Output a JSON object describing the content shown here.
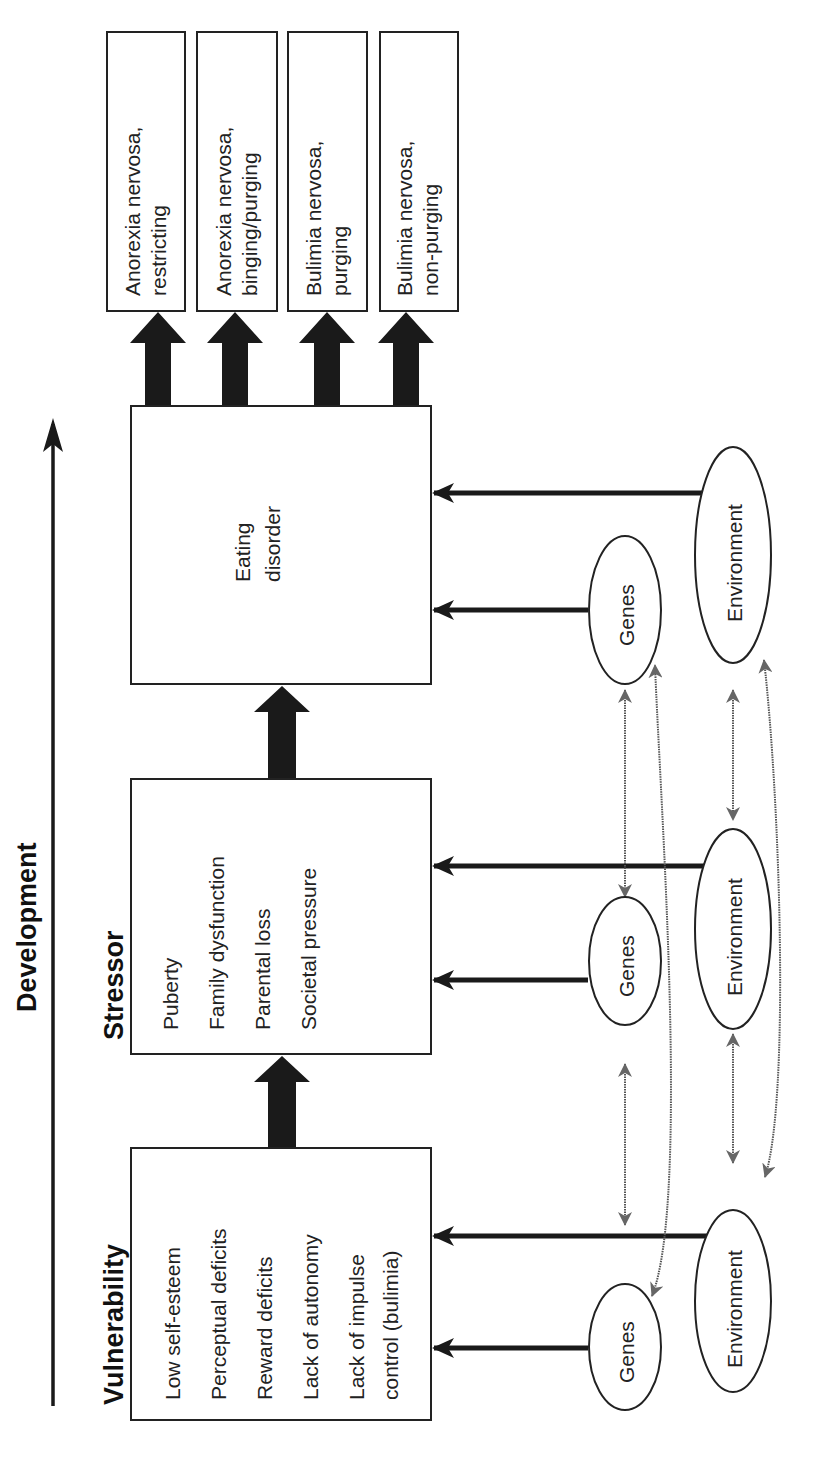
{
  "axis": {
    "label": "Development"
  },
  "stages": {
    "vulnerability": {
      "title": "Vulnerability",
      "items": [
        "Low self-esteem",
        "Perceptual deficits",
        "Reward deficits",
        "Lack of autonomy",
        "Lack of impulse",
        "control (bulimia)"
      ]
    },
    "stressor": {
      "title": "Stressor",
      "items": [
        "Puberty",
        "Family dysfunction",
        "Parental loss",
        "Societal pressure"
      ]
    },
    "eating_disorder": {
      "line1": "Eating",
      "line2": "disorder"
    }
  },
  "outcomes": [
    {
      "line1": "Anorexia nervosa,",
      "line2": "restricting"
    },
    {
      "line1": "Anorexia nervosa,",
      "line2": "binging/purging"
    },
    {
      "line1": "Bulimia nervosa,",
      "line2": "purging"
    },
    {
      "line1": "Bulimia nervosa,",
      "line2": "non-purging"
    }
  ],
  "factors": {
    "genes_label": "Genes",
    "environment_label": "Environment"
  }
}
